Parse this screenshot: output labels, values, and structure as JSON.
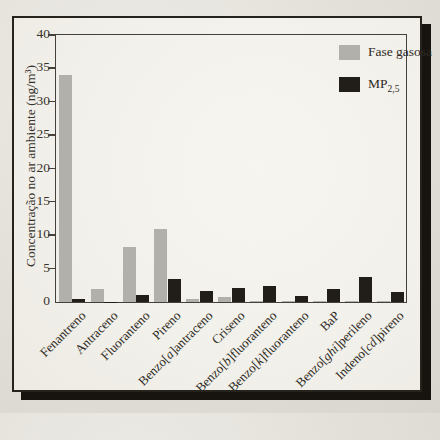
{
  "figure": {
    "page_background": "#e2dfd8",
    "panel_background": "#f4f2ec",
    "frame_border_color": "#26221c",
    "frame_shadow_color": "#17140f",
    "axis_color": "#45413a",
    "text_color": "#37332c"
  },
  "chart_data": {
    "type": "bar",
    "title": "",
    "xlabel": "",
    "ylabel": "Concentração no ar ambiente (ng/m³)",
    "ylim": [
      0,
      40
    ],
    "yticks": [
      0,
      5,
      10,
      15,
      20,
      25,
      30,
      35,
      40
    ],
    "grid": false,
    "legend_position": "top-right",
    "categories": [
      "Fenantreno",
      "Antraceno",
      "Fluoranteno",
      "Pireno",
      "Benzo[a]antraceno",
      "Criseno",
      "Benzo[b]fluoranteno",
      "Benzo[k]fluoranteno",
      "BaP",
      "Benzo[ghi]perileno",
      "Indeno[cd]pireno"
    ],
    "series": [
      {
        "name": "Fase gasosa",
        "color": "#b2b0ab",
        "values": [
          34,
          2,
          8.3,
          11,
          0.5,
          0.8,
          0.1,
          0.1,
          0.1,
          0.1,
          0.1
        ]
      },
      {
        "name": "MP",
        "name_sub": "2,5",
        "color": "#211e1a",
        "values": [
          0.5,
          0.05,
          1.1,
          3.4,
          1.6,
          2.1,
          2.4,
          0.9,
          2.0,
          3.7,
          1.5
        ]
      }
    ]
  }
}
